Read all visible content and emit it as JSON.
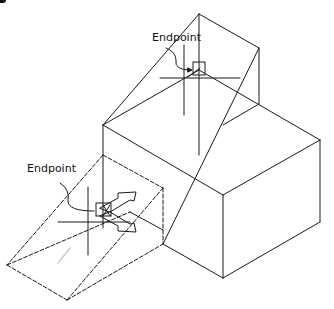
{
  "figure": {
    "labels": {
      "upper_snap": "Endpoint",
      "lower_snap": "Endpoint"
    },
    "colors": {
      "line": "#1a1a1a",
      "background": "#ffffff"
    }
  }
}
